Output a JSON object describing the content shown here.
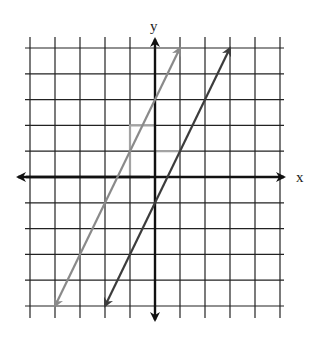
{
  "diagram": {
    "type": "coordinate-plane",
    "axes": {
      "x_label": "x",
      "y_label": "y"
    },
    "grid": {
      "x_range": [
        -5,
        5
      ],
      "y_range": [
        -5,
        5
      ],
      "origin_px": [
        155,
        177
      ],
      "unit_px_x": 25,
      "unit_px_y": 25.8
    },
    "lines": [
      {
        "name": "line-a",
        "color": "#8a8a8a",
        "slope": 2,
        "y_intercept": 2,
        "from": [
          -4,
          -5
        ],
        "to": [
          1,
          5
        ]
      },
      {
        "name": "line-b",
        "color": "#3c3c3c",
        "slope": 2,
        "y_intercept": -1,
        "from": [
          -2,
          -5
        ],
        "to": [
          3,
          5
        ]
      }
    ],
    "slope_triangles": [
      {
        "name": "rise-run-a",
        "color": "#a3a3a3",
        "rise_from": [
          -1,
          0
        ],
        "corner": [
          -1,
          2
        ],
        "run_to": [
          0,
          2
        ]
      },
      {
        "name": "rise-run-b",
        "color": "#a3a3a3",
        "rise_from": [
          0,
          -1
        ],
        "corner": [
          0,
          1
        ],
        "run_to": [
          1,
          1
        ]
      }
    ],
    "colors": {
      "grid": "#222222",
      "axis": "#111111"
    }
  }
}
